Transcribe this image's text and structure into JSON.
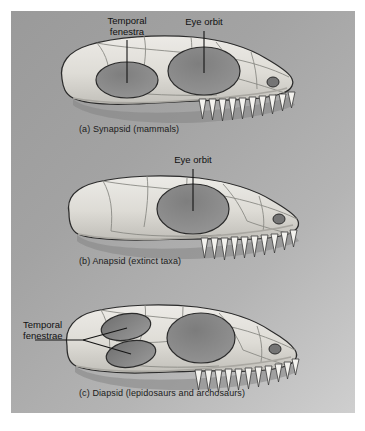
{
  "figure": {
    "background_color": "#a5a5a5",
    "panels": [
      {
        "id": "a",
        "caption": "(a) Synapsid (mammals)",
        "labels": [
          {
            "name": "temporal-fenestra",
            "text_line1": "Temporal",
            "text_line2": "fenestra"
          },
          {
            "name": "eye-orbit",
            "text_line1": "Eye orbit",
            "text_line2": ""
          }
        ],
        "openings": [
          "temporal fenestra",
          "eye orbit"
        ],
        "tooth_count": 10
      },
      {
        "id": "b",
        "caption": "(b) Anapsid (extinct taxa)",
        "labels": [
          {
            "name": "eye-orbit",
            "text_line1": "Eye orbit",
            "text_line2": ""
          }
        ],
        "openings": [
          "eye orbit"
        ],
        "tooth_count": 10
      },
      {
        "id": "c",
        "caption": "(c) Diapsid (lepidosaurs and archosaurs)",
        "labels": [
          {
            "name": "temporal-fenestrae",
            "text_line1": "Temporal",
            "text_line2": "fenestrae"
          }
        ],
        "openings": [
          "upper temporal fenestra",
          "lower temporal fenestra",
          "eye orbit"
        ],
        "tooth_count": 11
      }
    ],
    "colors": {
      "bone_light": "#e8e8e4",
      "bone_mid": "#d3d3cd",
      "bone_shade": "#b8b8b2",
      "opening_fill": "#8d8d8d",
      "outline": "#2b2b2b",
      "shadow": "#7d7d7d",
      "tooth": "#f2f2ee"
    }
  }
}
